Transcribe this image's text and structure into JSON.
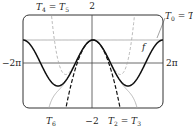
{
  "chart_data": {
    "type": "line",
    "title": "",
    "xlabel": "",
    "ylabel": "",
    "xlim": [
      -6.2832,
      6.2832
    ],
    "ylim": [
      -2,
      2
    ],
    "x_tick_labels": {
      "left": "−2π",
      "right": "2π"
    },
    "y_tick_labels": {
      "top": "2",
      "bottom": "−2"
    },
    "grid": false,
    "reference_line_y": 1,
    "series": [
      {
        "name": "f",
        "function": "cos(x)",
        "style": "solid-bold",
        "color": "#111111"
      },
      {
        "name": "T0 = T1",
        "function": "1",
        "style": "solid-thin",
        "color": "#9a9a9a"
      },
      {
        "name": "T2 = T3",
        "function": "1 - x^2/2",
        "style": "dashed-bold",
        "color": "#111111"
      },
      {
        "name": "T4 = T5",
        "function": "1 - x^2/2 + x^4/24",
        "style": "dashed-thin",
        "color": "#aaaaaa"
      },
      {
        "name": "T6",
        "function": "1 - x^2/2 + x^4/24 - x^6/720",
        "style": "solid-thin",
        "color": "#aaaaaa"
      }
    ],
    "annotations": [
      {
        "text": "T4 = T5",
        "position": "top-left"
      },
      {
        "text": "T0 = T1",
        "position": "top-right"
      },
      {
        "text": "f",
        "position": "right-middle"
      },
      {
        "text": "T6",
        "position": "bottom-left"
      },
      {
        "text": "T2 = T3",
        "position": "bottom-right"
      }
    ]
  },
  "labels": {
    "y_top": "2",
    "y_bottom": "−2",
    "x_left": "−2π",
    "x_right": "2π",
    "t45": {
      "a": "T",
      "a_sub": "4",
      "eq": " = ",
      "b": "T",
      "b_sub": "5"
    },
    "t01": {
      "a": "T",
      "a_sub": "0",
      "eq": " = ",
      "b": "T",
      "b_sub": "1"
    },
    "t23": {
      "a": "T",
      "a_sub": "2",
      "eq": " = ",
      "b": "T",
      "b_sub": "3"
    },
    "t6": {
      "a": "T",
      "a_sub": "6"
    },
    "f": "f"
  }
}
